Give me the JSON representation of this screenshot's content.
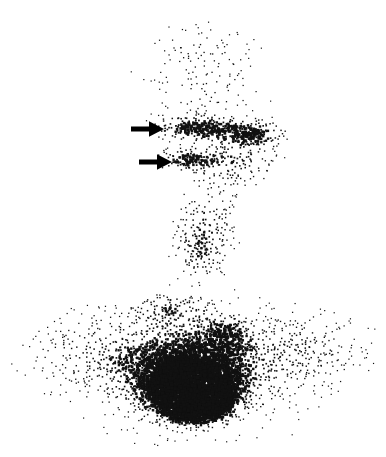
{
  "image": {
    "kind": "nuclear-medicine-scintigram",
    "modality_label": "scintigram",
    "width": 386,
    "height": 457,
    "background_color": "#ffffff",
    "dot_color": "#111111",
    "rendering": "dot-density persistence display",
    "orientation": "anterior view, head at top, thorax at bottom"
  },
  "annotations": {
    "arrows": [
      {
        "name": "upper-arrow",
        "label": "arrow-1",
        "direction": "right",
        "x": 131,
        "y": 120,
        "length": 28,
        "thickness": 6,
        "color": "#000000"
      },
      {
        "name": "lower-arrow",
        "label": "arrow-2",
        "direction": "right",
        "x": 139,
        "y": 153,
        "length": 28,
        "thickness": 6,
        "color": "#000000"
      }
    ]
  },
  "chart_data": {
    "type": "heatmap",
    "title": "",
    "subtitle": "",
    "xlabel": "",
    "ylabel": "",
    "legend": [],
    "grid": false,
    "xlim": [
      0,
      386
    ],
    "ylim": [
      0,
      457
    ],
    "encoding": "dot density proportional to radiotracer counts",
    "dot_size_px": 1.6,
    "sample_grid_step_px": 2.6,
    "max_dot_probability": 1.0,
    "regions": [
      {
        "name": "cranium",
        "shape": "ellipse",
        "cx": 203,
        "cy": 95,
        "rx": 96,
        "ry": 92,
        "intensity": 0.16,
        "falloff": 1.5,
        "note": "sparse diffuse background uptake over skull"
      },
      {
        "name": "cranium-vertex",
        "shape": "ellipse",
        "cx": 200,
        "cy": 45,
        "rx": 76,
        "ry": 40,
        "intensity": 0.1,
        "falloff": 1.6,
        "note": "faintest region at top of head"
      },
      {
        "name": "salivary-band-left",
        "shape": "ellipse",
        "cx": 195,
        "cy": 128,
        "rx": 58,
        "ry": 17,
        "intensity": 0.72,
        "falloff": 1.1,
        "note": "dense transverse band at level of upper arrow"
      },
      {
        "name": "salivary-band-right",
        "shape": "ellipse",
        "cx": 255,
        "cy": 133,
        "rx": 46,
        "ry": 20,
        "intensity": 0.66,
        "falloff": 1.2,
        "note": "right-sided continuation of dense band"
      },
      {
        "name": "focus-lower-neck-left",
        "shape": "ellipse",
        "cx": 186,
        "cy": 160,
        "rx": 42,
        "ry": 16,
        "intensity": 0.62,
        "falloff": 1.2,
        "note": "second band at level of lower arrow"
      },
      {
        "name": "jaw-mass",
        "shape": "ellipse",
        "cx": 232,
        "cy": 160,
        "rx": 62,
        "ry": 42,
        "intensity": 0.46,
        "falloff": 1.3,
        "note": "broad moderate uptake over mandible / right neck"
      },
      {
        "name": "neck-column",
        "shape": "ellipse",
        "cx": 205,
        "cy": 225,
        "rx": 48,
        "ry": 58,
        "intensity": 0.4,
        "falloff": 1.3,
        "note": "vertical neck activity column"
      },
      {
        "name": "neck-column-narrow",
        "shape": "ellipse",
        "cx": 200,
        "cy": 255,
        "rx": 36,
        "ry": 44,
        "intensity": 0.33,
        "falloff": 1.4,
        "note": "narrowing of neck toward thoracic inlet"
      },
      {
        "name": "thorax-broad",
        "shape": "ellipse",
        "cx": 196,
        "cy": 368,
        "rx": 186,
        "ry": 96,
        "intensity": 0.3,
        "falloff": 1.5,
        "note": "wide shoulder / upper-chest background spanning full frame"
      },
      {
        "name": "shoulder-left",
        "shape": "ellipse",
        "cx": 96,
        "cy": 352,
        "rx": 104,
        "ry": 62,
        "intensity": 0.26,
        "falloff": 1.6,
        "note": "left shoulder field"
      },
      {
        "name": "shoulder-right",
        "shape": "ellipse",
        "cx": 300,
        "cy": 348,
        "rx": 96,
        "ry": 60,
        "intensity": 0.26,
        "falloff": 1.6,
        "note": "right shoulder field"
      },
      {
        "name": "mediastinal-uptake",
        "shape": "ellipse",
        "cx": 190,
        "cy": 372,
        "rx": 104,
        "ry": 62,
        "intensity": 0.8,
        "falloff": 1.25,
        "note": "intense mediastinal / cardiac blood-pool activity"
      },
      {
        "name": "hot-core",
        "shape": "ellipse",
        "cx": 192,
        "cy": 396,
        "rx": 66,
        "ry": 40,
        "intensity": 1.0,
        "falloff": 1.2,
        "note": "saturated black core of maximum counts"
      },
      {
        "name": "hot-core-inner",
        "shape": "ellipse",
        "cx": 196,
        "cy": 402,
        "rx": 44,
        "ry": 26,
        "intensity": 1.0,
        "falloff": 1.0,
        "note": "fully confluent centre"
      },
      {
        "name": "supraclavicular-streak",
        "shape": "ellipse",
        "cx": 170,
        "cy": 310,
        "rx": 56,
        "ry": 28,
        "intensity": 0.46,
        "falloff": 1.4,
        "note": "streaky activity over thoracic inlet"
      },
      {
        "name": "paratracheal-streak",
        "shape": "ellipse",
        "cx": 225,
        "cy": 330,
        "rx": 48,
        "ry": 30,
        "intensity": 0.4,
        "falloff": 1.4,
        "note": "right paratracheal streak"
      }
    ],
    "cutouts": [
      {
        "name": "left-neck-notch",
        "shape": "ellipse",
        "cx": 122,
        "cy": 232,
        "rx": 62,
        "ry": 58,
        "note": "air gap lateral to left neck"
      },
      {
        "name": "right-neck-notch",
        "shape": "ellipse",
        "cx": 300,
        "cy": 238,
        "rx": 58,
        "ry": 56,
        "note": "air gap lateral to right neck"
      },
      {
        "name": "left-temple-void",
        "shape": "ellipse",
        "cx": 120,
        "cy": 150,
        "rx": 26,
        "ry": 24,
        "note": "relative photopenia anterior to left arrow"
      },
      {
        "name": "upper-left-void",
        "shape": "ellipse",
        "cx": 60,
        "cy": 120,
        "rx": 60,
        "ry": 90,
        "note": "empty field left of head"
      },
      {
        "name": "upper-right-void",
        "shape": "ellipse",
        "cx": 350,
        "cy": 120,
        "rx": 60,
        "ry": 90,
        "note": "empty field right of head"
      },
      {
        "name": "bottom-left-corner-void",
        "shape": "ellipse",
        "cx": 10,
        "cy": 452,
        "rx": 70,
        "ry": 50,
        "note": "corner outside body outline"
      },
      {
        "name": "bottom-right-corner-void",
        "shape": "ellipse",
        "cx": 378,
        "cy": 452,
        "rx": 70,
        "ry": 50,
        "note": "corner outside body outline"
      }
    ]
  },
  "accessibility": {
    "alt_text": "Dot-density radionuclide scintigram showing a head, neck and upper chest in anterior projection. Faint diffuse dots outline the skull, a denser transverse band crosses the mid-face and upper neck, and a very intense confluent black area occupies the lower neck and mediastinum. Two solid black arrows point rightwards at the left side of the neck."
  }
}
